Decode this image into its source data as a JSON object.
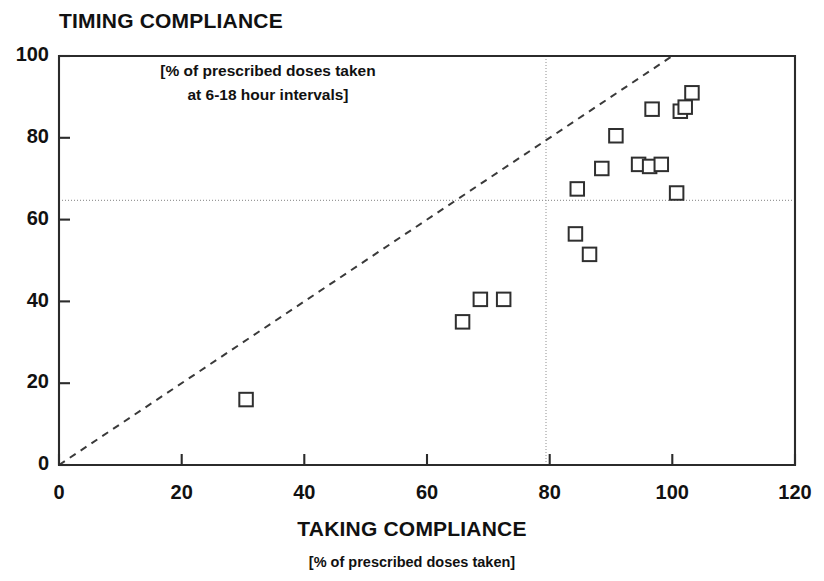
{
  "chart_data": {
    "type": "scatter",
    "title": "TIMING COMPLIANCE",
    "subtitle_line1": "[% of prescribed doses taken",
    "subtitle_line2": "at 6-18 hour intervals]",
    "xlabel": "TAKING COMPLIANCE",
    "xlabel_sub": "[% of prescribed doses taken]",
    "ylabel": "TIMING COMPLIANCE",
    "ylabel_sub": "[% of prescribed doses taken at 6-18 hour intervals]",
    "xlim": [
      0,
      120
    ],
    "ylim": [
      0,
      100
    ],
    "xticks": [
      0,
      20,
      40,
      60,
      80,
      100,
      120
    ],
    "yticks": [
      0,
      20,
      40,
      60,
      80,
      100
    ],
    "xtick_labels": [
      "0",
      "20",
      "40",
      "60",
      "80",
      "100",
      "120"
    ],
    "ytick_labels": [
      "0",
      "20",
      "40",
      "60",
      "80",
      "100"
    ],
    "grid": false,
    "legend": "none",
    "marker_style": "open-square",
    "points": [
      {
        "x": 30.5,
        "y": 16.0
      },
      {
        "x": 65.8,
        "y": 35.0
      },
      {
        "x": 68.7,
        "y": 40.5
      },
      {
        "x": 72.5,
        "y": 40.5
      },
      {
        "x": 84.2,
        "y": 56.5
      },
      {
        "x": 86.5,
        "y": 51.5
      },
      {
        "x": 84.5,
        "y": 67.5
      },
      {
        "x": 88.5,
        "y": 72.5
      },
      {
        "x": 90.8,
        "y": 80.5
      },
      {
        "x": 94.5,
        "y": 73.5
      },
      {
        "x": 96.3,
        "y": 73.0
      },
      {
        "x": 98.2,
        "y": 73.5
      },
      {
        "x": 100.7,
        "y": 66.5
      },
      {
        "x": 96.7,
        "y": 87.0
      },
      {
        "x": 101.3,
        "y": 86.5
      },
      {
        "x": 102.1,
        "y": 87.5
      },
      {
        "x": 103.2,
        "y": 91.0
      }
    ],
    "reference_lines": [
      {
        "name": "identity-line",
        "type": "diagonal",
        "style": "dashed",
        "from": [
          0,
          0
        ],
        "to": [
          100,
          100
        ],
        "label": "y = x"
      },
      {
        "name": "timing-threshold",
        "type": "horizontal",
        "style": "dotted",
        "value": 65
      },
      {
        "name": "taking-threshold",
        "type": "vertical",
        "style": "dotted",
        "value": 80
      }
    ]
  },
  "colors": {
    "background": "#ffffff",
    "axis": "#2b2b2b",
    "marker_stroke": "#2f2f2f",
    "marker_fill": "#ffffff",
    "reference": "#9a9a9a",
    "identity": "#3a3a3a",
    "text": "#111111"
  }
}
